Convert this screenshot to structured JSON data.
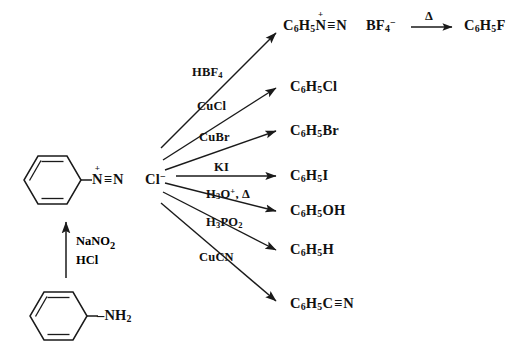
{
  "diagram": {
    "type": "reaction-scheme",
    "stroke_color": "#1a1a1a",
    "background_color": "#ffffff"
  },
  "starting_material": {
    "name": "aniline",
    "ring_label": "benzene-ring",
    "substituent": "–NH",
    "substituent_sub": "2"
  },
  "diazotization": {
    "arrow": "up-arrow",
    "reagent_line_1": "NaNO",
    "reagent_line_1_sub": "2",
    "reagent_line_2": "HCl"
  },
  "intermediate": {
    "name": "benzenediazonium chloride",
    "ring_label": "benzene-ring",
    "nitrogen": "N",
    "charge": "+",
    "bond": "≡",
    "nitrogen2": "N",
    "counterion": "Cl",
    "counterion_charge": "−"
  },
  "branches": [
    {
      "id": "fluorobenzene",
      "reagent": "HBF",
      "reagent_sub": "4",
      "reagent_tail": "",
      "product": "C",
      "product_sub1": "6",
      "product_mid": "H",
      "product_sub2": "5",
      "product_tail": ""
    },
    {
      "id": "chlorobenzene",
      "reagent": "CuCl",
      "reagent_sub": "",
      "product_text": "C6H5Cl"
    },
    {
      "id": "bromobenzene",
      "reagent": "CuBr",
      "reagent_sub": "",
      "product_text": "C6H5Br"
    },
    {
      "id": "iodobenzene",
      "reagent": "KI",
      "reagent_sub": "",
      "product_text": "C6H5I"
    },
    {
      "id": "phenol",
      "reagent": "H3O+, Δ",
      "reagent_sub": "",
      "product_text": "C6H5OH"
    },
    {
      "id": "benzene",
      "reagent": "H3PO2",
      "reagent_sub": "",
      "product_text": "C6H5H"
    },
    {
      "id": "benzonitrile",
      "reagent": "CuCN",
      "reagent_sub": "",
      "product_text": "C6H5CN"
    }
  ],
  "products": {
    "diazonium_tetrafluoroborate": {
      "c": "C",
      "c_sub": "6",
      "h": "H",
      "h_sub": "5",
      "n1": "N",
      "charge": "+",
      "bond": "≡",
      "n2": "N",
      "anion": "BF",
      "anion_sub": "4",
      "anion_charge": "−"
    },
    "fluorobenzene": {
      "text_parts": [
        "C",
        "6",
        "H",
        "5",
        "F"
      ]
    },
    "chlorobenzene": {
      "text_parts": [
        "C",
        "6",
        "H",
        "5",
        "Cl"
      ]
    },
    "bromobenzene": {
      "text_parts": [
        "C",
        "6",
        "H",
        "5",
        "Br"
      ]
    },
    "iodobenzene": {
      "text_parts": [
        "C",
        "6",
        "H",
        "5",
        "I"
      ]
    },
    "phenol": {
      "text_parts": [
        "C",
        "6",
        "H",
        "5",
        "OH"
      ]
    },
    "benzene": {
      "text_parts": [
        "C",
        "6",
        "H",
        "5",
        "H"
      ]
    },
    "benzonitrile": {
      "text_parts": [
        "C",
        "6",
        "H",
        "5",
        "C",
        "≡",
        "N"
      ]
    }
  },
  "thermal_step": {
    "reagent": "Δ",
    "arrow": "right-arrow"
  },
  "text": {
    "C": "C",
    "H": "H",
    "N": "N",
    "F": "F",
    "Cl": "Cl",
    "Br": "Br",
    "I": "I",
    "OH": "OH",
    "B": "B",
    "BF": "BF",
    "sub6": "6",
    "sub5": "5",
    "sub4": "4",
    "sub3": "3",
    "sub2": "2",
    "plus": "+",
    "minus": "−",
    "triple": "≡",
    "delta": "Δ",
    "comma_delta": ", Δ",
    "HBF": "HBF",
    "CuCl": "CuCl",
    "CuBr": "CuBr",
    "KI": "KI",
    "H3O": "H",
    "O": "O",
    "PO": "PO",
    "CuCN": "CuCN",
    "NaNO": "NaNO",
    "HCl": "HCl",
    "NH": "–NH",
    "dash": "–"
  }
}
